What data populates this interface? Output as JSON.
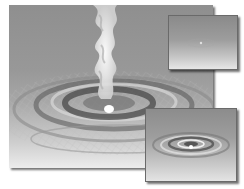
{
  "illustration": {
    "description": "Grayscale 3D render of a liquid/smoke stream falling onto a wireframe water surface creating concentric ripples",
    "panels": [
      {
        "id": "main",
        "subject": "smoke stream and ripple mesh"
      },
      {
        "id": "inset-top",
        "subject": "flat water surface with faint center point"
      },
      {
        "id": "inset-bottom",
        "subject": "shaded concentric ripples"
      }
    ],
    "colors": {
      "background": "#ffffff",
      "surface_dark": "#8f8f8f",
      "surface_light": "#ececec",
      "stream": "#f4f4f4",
      "ripple_shadow": "#3a3a3a"
    }
  }
}
